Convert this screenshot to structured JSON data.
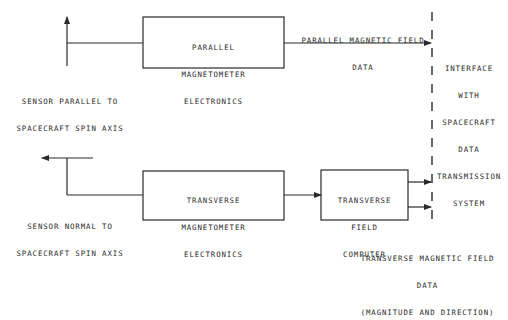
{
  "diagram": {
    "blocks": {
      "parallel_electronics": [
        "PARALLEL",
        "MAGNETOMETER",
        "ELECTRONICS"
      ],
      "transverse_electronics": [
        "TRANSVERSE",
        "MAGNETOMETER",
        "ELECTRONICS"
      ],
      "transverse_computer": [
        "TRANSVERSE",
        "FIELD",
        "COMPUTER"
      ]
    },
    "labels": {
      "sensor_parallel": [
        "SENSOR PARALLEL TO",
        "SPACECRAFT SPIN AXIS"
      ],
      "sensor_normal": [
        "SENSOR NORMAL TO",
        "SPACECRAFT SPIN AXIS"
      ],
      "parallel_data": [
        "PARALLEL MAGNETIC FIELD",
        "DATA"
      ],
      "interface": [
        "INTERFACE",
        "WITH",
        "SPACECRAFT",
        "DATA",
        "TRANSMISSION",
        "SYSTEM"
      ],
      "transverse_data": [
        "TRANSVERSE MAGNETIC FIELD",
        "DATA",
        "(MAGNITUDE AND DIRECTION)"
      ]
    },
    "colors": {
      "line": "#2a2a2a",
      "background": "#ffffff"
    }
  }
}
